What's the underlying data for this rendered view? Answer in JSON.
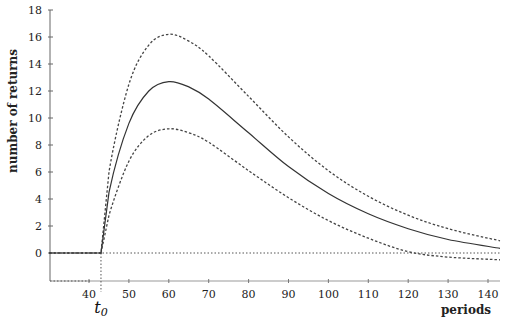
{
  "chart_data": {
    "type": "line",
    "title": "",
    "xlabel": "periods",
    "ylabel": "number of returns",
    "xlim": [
      30,
      145
    ],
    "ylim": [
      -2.3,
      18
    ],
    "x_ticks": [
      40,
      50,
      60,
      70,
      80,
      90,
      100,
      110,
      120,
      130,
      140
    ],
    "y_ticks": [
      0,
      2,
      4,
      6,
      8,
      10,
      12,
      14,
      16,
      18
    ],
    "annotation": {
      "label": "t0",
      "x": 43
    },
    "grid": false,
    "legend": null,
    "series": [
      {
        "name": "upper bound",
        "style": "dashed",
        "x": [
          30,
          43,
          45,
          50,
          55,
          60,
          65,
          70,
          80,
          90,
          100,
          110,
          120,
          130,
          143
        ],
        "y": [
          0,
          0,
          6.0,
          12.5,
          15.4,
          16.2,
          15.7,
          14.6,
          11.6,
          8.6,
          6.1,
          4.2,
          2.8,
          1.8,
          0.9
        ]
      },
      {
        "name": "expected returns",
        "style": "solid",
        "x": [
          30,
          43,
          45,
          50,
          55,
          60,
          65,
          70,
          80,
          90,
          100,
          110,
          120,
          130,
          143
        ],
        "y": [
          0,
          0,
          4.5,
          9.6,
          12.0,
          12.7,
          12.3,
          11.4,
          8.9,
          6.4,
          4.4,
          2.9,
          1.8,
          1.0,
          0.35
        ]
      },
      {
        "name": "lower bound",
        "style": "dashed",
        "x": [
          43,
          45,
          50,
          55,
          60,
          65,
          70,
          80,
          90,
          100,
          110,
          120,
          130,
          143
        ],
        "y": [
          0,
          2.8,
          6.8,
          8.7,
          9.2,
          8.9,
          8.2,
          6.1,
          4.1,
          2.4,
          1.1,
          0.1,
          -0.3,
          -0.5
        ]
      }
    ]
  }
}
